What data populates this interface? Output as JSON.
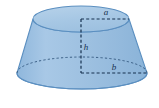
{
  "figure": {
    "name": "frustum-of-a-cone",
    "background_color": "#ffffff",
    "body_fill_color": "#9dc0e0",
    "body_fill_color_light": "#b4d0e8",
    "outline_color": "#5b8fc0",
    "dash_color": "#16314f",
    "labels": {
      "top_radius": "a",
      "height": "h",
      "bottom_radius": "b"
    },
    "geometry": {
      "top_ellipse": {
        "cx": 81,
        "cy": 19,
        "rx": 48,
        "ry": 13
      },
      "bottom_ellipse": {
        "cx": 82,
        "cy": 73,
        "rx": 65,
        "ry": 16
      },
      "height_line": {
        "x": 81,
        "y_top": 19,
        "y_bottom": 73
      },
      "top_radius_line": {
        "x_start": 81,
        "x_end": 129,
        "y": 19
      },
      "bottom_radius_line": {
        "x_start": 81,
        "x_end": 147,
        "y": 73
      }
    },
    "label_positions": {
      "top_radius": {
        "x": 106,
        "y": 15
      },
      "height": {
        "x": 85,
        "y": 49
      },
      "bottom_radius": {
        "x": 113,
        "y": 69
      }
    }
  }
}
